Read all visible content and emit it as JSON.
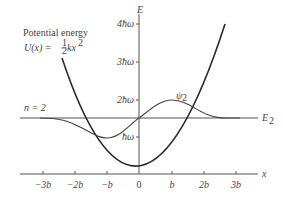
{
  "diagram": {
    "title": "Potential energy",
    "formula": {
      "prefix": "U(x) = ",
      "frac_num": "1",
      "frac_den": "2",
      "suffix": "kx",
      "exp": "2"
    },
    "state_label": "n = 2",
    "energy_level_label": {
      "main": "E",
      "sub": "2"
    },
    "wavefunction_label": {
      "main": "ψ",
      "sub": "2"
    },
    "axes": {
      "x_label": "x",
      "y_label": "E",
      "x_ticks": [
        "−3b",
        "−2b",
        "−b",
        "0",
        "b",
        "2b",
        "3b"
      ],
      "y_ticks": [
        "ħω",
        "2ħω",
        "3ħω",
        "4ħω"
      ]
    },
    "colors": {
      "curve": "#2a2a2a",
      "axis": "#555555",
      "text": "#444444"
    }
  }
}
